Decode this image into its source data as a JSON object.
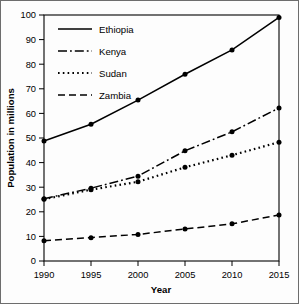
{
  "chart_data": {
    "type": "line",
    "title": "",
    "xlabel": "Year",
    "ylabel": "Population in millions",
    "x": [
      1990,
      1995,
      2000,
      2005,
      2010,
      2015
    ],
    "xtick_labels": [
      "1990",
      "1995",
      "2000",
      "2005",
      "2010",
      "2015"
    ],
    "ytick_labels": [
      "0",
      "10",
      "20",
      "30",
      "40",
      "50",
      "60",
      "70",
      "80",
      "90",
      "100"
    ],
    "yticks": [
      0,
      10,
      20,
      30,
      40,
      50,
      60,
      70,
      80,
      90,
      100
    ],
    "xlim": [
      1990,
      2015
    ],
    "ylim": [
      0,
      100
    ],
    "grid": false,
    "legend_position": "top-left",
    "series": [
      {
        "name": "Ethiopia",
        "line_style": "solid",
        "color": "#000000",
        "values": [
          48.8,
          55.6,
          65.4,
          75.9,
          85.8,
          99.0
        ]
      },
      {
        "name": "Kenya",
        "line_style": "dash-dot",
        "color": "#000000",
        "values": [
          25.3,
          29.6,
          34.5,
          44.8,
          52.5,
          62.2
        ]
      },
      {
        "name": "Sudan",
        "line_style": "dotted",
        "color": "#000000",
        "values": [
          25.1,
          29.0,
          32.2,
          38.1,
          43.0,
          48.3
        ]
      },
      {
        "name": "Zambia",
        "line_style": "dashed",
        "color": "#000000",
        "values": [
          8.2,
          9.5,
          10.8,
          13.0,
          15.1,
          18.7
        ]
      }
    ]
  }
}
